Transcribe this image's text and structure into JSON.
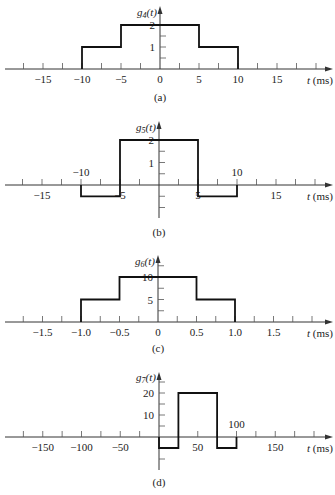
{
  "chart_data": [
    {
      "type": "line",
      "subtitle": "(a)",
      "ylabel": "g4(t)",
      "ylabel_main": "g",
      "ylabel_sub": "4",
      "xlabel": "t (ms)",
      "x_tick_labels": [
        "-15",
        "-10",
        "-5",
        "0",
        "5",
        "10",
        "15"
      ],
      "x_tick_values": [
        -15,
        -10,
        -5,
        0,
        5,
        10,
        15
      ],
      "y_tick_labels": [
        "1",
        "2"
      ],
      "y_tick_values": [
        1,
        2
      ],
      "minor_x_step": 2.5,
      "minor_y_step": 0.5,
      "xlim": [
        -20.5,
        22
      ],
      "ylim": [
        0,
        2.5
      ],
      "x": [
        -10,
        -10,
        -5,
        -5,
        5,
        5,
        10,
        10
      ],
      "y": [
        0,
        1,
        1,
        2,
        2,
        1,
        1,
        0
      ],
      "layout": {
        "origin_x": 160,
        "axis_y": 69,
        "px_per_x": 7.8,
        "px_per_y": 22,
        "y_top": 6,
        "y_bottom": 69,
        "label_y": 101,
        "ylabel_y": 16
      }
    },
    {
      "type": "line",
      "subtitle": "(b)",
      "ylabel": "g5(t)",
      "ylabel_main": "g",
      "ylabel_sub": "5",
      "xlabel": "t (ms)",
      "x_tick_labels": [
        "-15",
        "-10",
        "-5",
        "5",
        "10",
        "15"
      ],
      "x_tick_values": [
        -15,
        -10,
        -5,
        5,
        10,
        15
      ],
      "x_tick_label_above": [
        false,
        true,
        false,
        false,
        true,
        false
      ],
      "y_tick_labels": [
        "1",
        "2"
      ],
      "y_tick_values": [
        1,
        2
      ],
      "minor_x_step": 2.5,
      "minor_y_step": 0.5,
      "xlim": [
        -20.5,
        22
      ],
      "ylim": [
        -1.5,
        2.5
      ],
      "x": [
        -10,
        -10,
        -5,
        -5,
        5,
        5,
        10,
        10
      ],
      "y": [
        0,
        -0.5,
        -0.5,
        2,
        2,
        -0.5,
        -0.5,
        0
      ],
      "layout": {
        "origin_x": 159,
        "axis_y": 185,
        "px_per_x": 7.8,
        "px_per_y": 22.5,
        "y_top": 121,
        "y_bottom": 218,
        "label_y": 236,
        "ylabel_y": 131
      }
    },
    {
      "type": "line",
      "subtitle": "(c)",
      "ylabel": "g6(t)",
      "ylabel_main": "g",
      "ylabel_sub": "6",
      "xlabel": "t (ms)",
      "x_tick_labels": [
        "-1.5",
        "-1.0",
        "-0.5",
        "0",
        "0.5",
        "1.0",
        "1.5"
      ],
      "x_tick_values": [
        -1.5,
        -1.0,
        -0.5,
        0,
        0.5,
        1.0,
        1.5
      ],
      "y_tick_labels": [
        "5",
        "10"
      ],
      "y_tick_values": [
        5,
        10
      ],
      "minor_x_step": 0.25,
      "minor_y_step": 2.5,
      "xlim": [
        -2.05,
        2.2
      ],
      "ylim": [
        0,
        12.5
      ],
      "x": [
        -1.0,
        -1.0,
        -0.5,
        -0.5,
        0.5,
        0.5,
        1.0,
        1.0
      ],
      "y": [
        0,
        5,
        5,
        10,
        10,
        5,
        5,
        0
      ],
      "layout": {
        "origin_x": 158,
        "axis_y": 322,
        "px_per_x": 77,
        "px_per_y": 4.5,
        "y_top": 255,
        "y_bottom": 322,
        "label_y": 352,
        "ylabel_y": 265
      }
    },
    {
      "type": "line",
      "subtitle": "(d)",
      "ylabel": "g7(t)",
      "ylabel_main": "g",
      "ylabel_sub": "7",
      "xlabel": "t (ms)",
      "x_tick_labels": [
        "-150",
        "-100",
        "-50",
        "50",
        "100",
        "150"
      ],
      "x_tick_values": [
        -150,
        -100,
        -50,
        50,
        100,
        150
      ],
      "x_tick_label_above": [
        false,
        false,
        false,
        false,
        true,
        false
      ],
      "y_tick_labels": [
        "10",
        "20"
      ],
      "y_tick_values": [
        10,
        20
      ],
      "minor_x_step": 25,
      "minor_y_step": 5,
      "xlim": [
        -205,
        220
      ],
      "ylim": [
        -15,
        27
      ],
      "x": [
        0,
        0,
        25,
        25,
        75,
        75,
        100,
        100
      ],
      "y": [
        0,
        -5,
        -5,
        20,
        20,
        -5,
        -5,
        0
      ],
      "layout": {
        "origin_x": 159,
        "axis_y": 437,
        "px_per_x": 0.775,
        "px_per_y": 2.2,
        "y_top": 372,
        "y_bottom": 470,
        "label_y": 486,
        "ylabel_y": 381
      }
    }
  ]
}
